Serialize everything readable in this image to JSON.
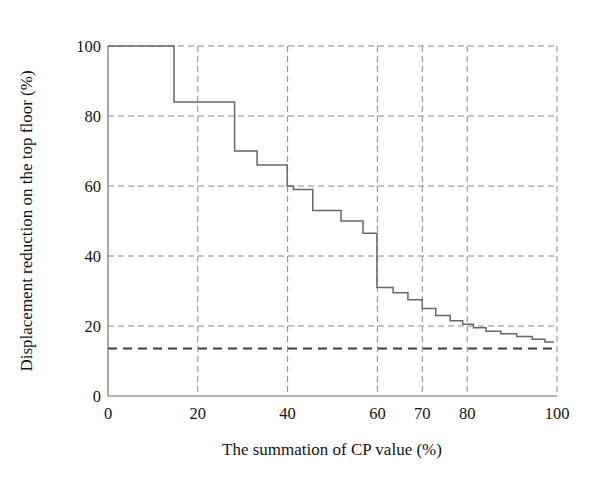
{
  "chart_data": {
    "type": "line",
    "subtype": "step",
    "title": "",
    "xlabel": "The summation of CP value (%)",
    "ylabel": "Displacement reduction on the top floor (%)",
    "xlim": [
      0,
      100
    ],
    "ylim": [
      0,
      100
    ],
    "xticks": [
      0,
      20,
      40,
      60,
      70,
      80,
      100
    ],
    "xticklabels": [
      "0",
      "20",
      "40",
      "60",
      "70",
      "80",
      "100"
    ],
    "yticks": [
      0,
      20,
      40,
      60,
      80,
      100
    ],
    "yticklabels": [
      "0",
      "20",
      "40",
      "60",
      "80",
      "100"
    ],
    "grid": true,
    "grid_style": "dashed",
    "legend": null,
    "series": [
      {
        "name": "Displacement reduction",
        "style": "step-post",
        "color": "#676767",
        "x": [
          0,
          14.7,
          14.7,
          28.2,
          28.2,
          33.2,
          33.2,
          39.9,
          39.9,
          41.3,
          41.3,
          45.6,
          45.6,
          51.9,
          51.9,
          56.8,
          56.8,
          59.9,
          59.9,
          63.5,
          63.5,
          66.8,
          66.8,
          70.0,
          70.0,
          73.0,
          73.0,
          76.2,
          76.2,
          79.0,
          79.0,
          81.4,
          81.4,
          84.2,
          84.2,
          87.5,
          87.5,
          91.0,
          91.0,
          94.5,
          94.5,
          97.3,
          97.3,
          99.3
        ],
        "y": [
          100,
          100,
          84,
          84,
          70,
          70,
          66,
          66,
          60,
          60,
          59,
          59,
          53,
          53,
          50,
          50,
          46.5,
          46.5,
          31,
          31,
          29.5,
          29.5,
          27.5,
          27.5,
          25,
          25,
          23,
          23,
          21.5,
          21.5,
          20.5,
          20.5,
          19.5,
          19.5,
          18.5,
          18.5,
          17.8,
          17.8,
          17,
          17,
          16.2,
          16.2,
          15.4,
          15.4
        ]
      }
    ],
    "annotations": [
      {
        "type": "horizontal-reference-line",
        "value": 15,
        "style": "dashed-bold",
        "color": "#3d3d3d",
        "label": ""
      }
    ]
  },
  "axes": {
    "x_title": "The summation of CP value (%)",
    "y_title": "Displacement reduction on the top floor (%)",
    "x_tick_labels": [
      "0",
      "20",
      "40",
      "60",
      "70",
      "80",
      "100"
    ],
    "y_tick_labels": [
      "0",
      "20",
      "40",
      "60",
      "80",
      "100"
    ]
  },
  "colors": {
    "curve": "#676767",
    "grid": "#8a8a8a",
    "axis": "#6e6e6e",
    "reference": "#3d3d3d",
    "background": "#ffffff",
    "text": "#131313"
  }
}
